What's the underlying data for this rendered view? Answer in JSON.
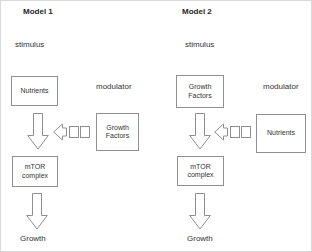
{
  "figure": {
    "background": "#ffffff",
    "line_color": "#8f8f8f",
    "text_color": "#333333"
  },
  "models": [
    {
      "title": "Model 1",
      "stimulus_label": "stimulus",
      "modulator_label": "modulator",
      "stimulus_box_label": "Nutrients",
      "modulator_box_label": "Growth Factors",
      "mtor_box_label": "mTOR complex",
      "output_label": "Growth"
    },
    {
      "title": "Model 2",
      "stimulus_label": "stimulus",
      "modulator_label": "modulator",
      "stimulus_box_label": "Growth Factors",
      "modulator_box_label": "Nutrients",
      "mtor_box_label": "mTOR complex",
      "output_label": "Growth"
    }
  ]
}
